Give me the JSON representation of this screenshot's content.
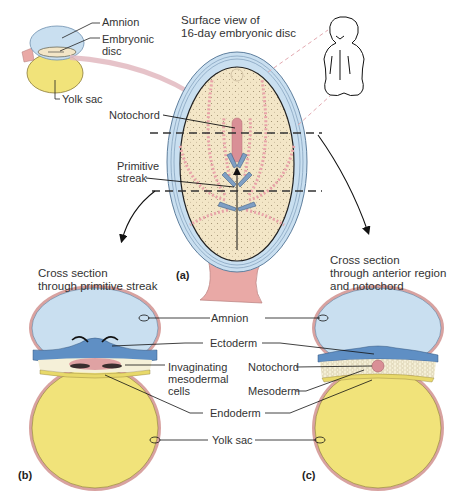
{
  "inset": {
    "labels": {
      "amnion": "Amnion",
      "embryonic_disc": "Embryonic\ndisc",
      "yolk_sac": "Yolk sac"
    }
  },
  "panel_a": {
    "letter": "(a)",
    "caption": "Surface view of\n16-day embryonic disc",
    "labels": {
      "notochord": "Notochord",
      "primitive_streak": "Primitive\nstreak"
    }
  },
  "panel_b": {
    "letter": "(b)",
    "caption": "Cross section\nthrough primitive streak",
    "labels": {
      "invaginating": "Invaginating\nmesodermal\ncells"
    }
  },
  "panel_c": {
    "letter": "(c)",
    "caption": "Cross section\nthrough anterior region\nand notochord",
    "labels": {
      "notochord": "Notochord",
      "mesoderm": "Mesoderm"
    }
  },
  "shared_labels": {
    "amnion": "Amnion",
    "ectoderm": "Ectoderm",
    "endoderm": "Endoderm",
    "yolk_sac": "Yolk sac"
  },
  "colors": {
    "amnion_blue": "#c9dff0",
    "ectoderm_blue": "#5f8fc4",
    "yolk_yellow": "#f1e37a",
    "disc_beige": "#f3e6c7",
    "pink_stalk": "#e9a9a6",
    "mesoderm_cream": "#f5f0d8",
    "notochord_pink": "#d98f96"
  }
}
